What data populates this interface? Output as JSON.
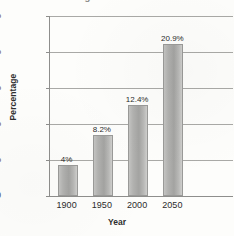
{
  "chart_data": {
    "type": "bar",
    "title": "Age 65 and Older",
    "xlabel": "Year",
    "ylabel": "Percentage",
    "categories": [
      "1900",
      "1950",
      "2000",
      "2050"
    ],
    "values": [
      4,
      8.2,
      12.4,
      20.9
    ],
    "value_labels": [
      "4%",
      "8.2%",
      "12.4%",
      "20.9%"
    ],
    "ylim": [
      0,
      25
    ],
    "ytick_values": [
      0,
      5,
      10,
      15,
      20,
      25
    ],
    "ytick_labels": [
      "0",
      "5%",
      "10%",
      "15%",
      "20%",
      "25%"
    ],
    "grid": true,
    "legend": false,
    "series_color": "#b2b2b0"
  }
}
